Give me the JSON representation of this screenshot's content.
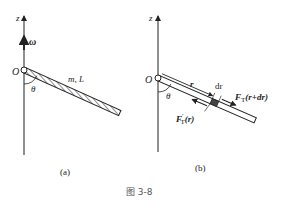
{
  "figure": {
    "caption": "图 3-8",
    "panel_a": {
      "label": "(a)",
      "axis_label": "z",
      "origin_label": "O",
      "angular_velocity_label": "ω",
      "angle_label": "θ",
      "rod_label": "m, L"
    },
    "panel_b": {
      "label": "(b)",
      "axis_label": "z",
      "origin_label": "O",
      "angle_label": "θ",
      "position_label": "r",
      "element_label": "dr",
      "force_right_main": "F",
      "force_right_sub": "T",
      "force_right_arg": "(r+dr)",
      "force_left_main": "F",
      "force_left_prime": "′",
      "force_left_sub": "T",
      "force_left_arg": "(r)"
    }
  }
}
